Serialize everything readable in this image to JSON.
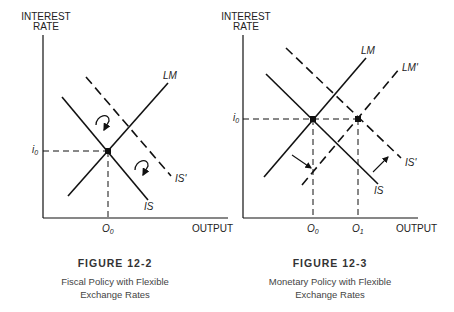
{
  "figures": [
    {
      "id": "fig-12-2",
      "y_axis_label_line1": "INTEREST",
      "y_axis_label_line2": "RATE",
      "x_axis_label": "OUTPUT",
      "i_label": "i",
      "i_sub": "0",
      "o0_label": "O",
      "o0_sub": "0",
      "curves": {
        "lm": "LM",
        "is": "IS",
        "is_prime": "IS'"
      },
      "caption_title": "FIGURE 12-2",
      "caption_line1": "Fiscal Policy with Flexible",
      "caption_line2": "Exchange Rates"
    },
    {
      "id": "fig-12-3",
      "y_axis_label_line1": "INTEREST",
      "y_axis_label_line2": "RATE",
      "x_axis_label": "OUTPUT",
      "i_label": "i",
      "i_sub": "0",
      "o0_label": "O",
      "o0_sub": "0",
      "o1_label": "O",
      "o1_sub": "1",
      "curves": {
        "lm": "LM",
        "lm_prime": "LM'",
        "is": "IS",
        "is_prime": "IS'"
      },
      "caption_title": "FIGURE 12-3",
      "caption_line1": "Monetary Policy with Flexible",
      "caption_line2": "Exchange Rates"
    }
  ]
}
